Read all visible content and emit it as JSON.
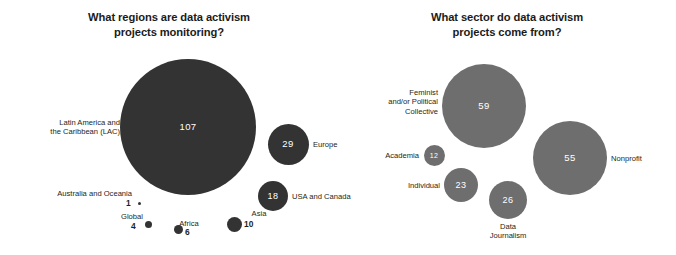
{
  "chart_data": [
    {
      "type": "bubble",
      "title": "What regions are data activism projects monitoring?",
      "title_lines": [
        "What regions are data activism",
        "projects monitoring?"
      ],
      "xlabel": "",
      "ylabel": "",
      "grid": false,
      "legend": "none",
      "bubble_color": "#333333",
      "value_label_color": "#ffffff",
      "categories": [
        "Latin America and the Caribbean (LAC)",
        "Europe",
        "USA and Canada",
        "Asia",
        "Africa",
        "Global",
        "Australia and Oceania"
      ],
      "values": [
        107,
        29,
        18,
        10,
        6,
        4,
        1
      ],
      "points": [
        {
          "label": "Latin America and\nthe Caribbean (LAC)",
          "value": "107",
          "cx": 188,
          "cy": 127,
          "d": 136,
          "value_inside": true,
          "label_pos": "left",
          "label_x": 24,
          "label_y": 118,
          "label_w": 96
        },
        {
          "label": "Europe",
          "value": "29",
          "cx": 288,
          "cy": 144,
          "d": 41,
          "value_inside": true,
          "label_pos": "right",
          "label_x": 313,
          "label_y": 140,
          "label_w": 60
        },
        {
          "label": "USA and Canada",
          "value": "18",
          "cx": 273,
          "cy": 196,
          "d": 30,
          "value_inside": true,
          "label_pos": "right",
          "label_x": 292,
          "label_y": 192,
          "label_w": 70
        },
        {
          "label": "Asia",
          "value": "10",
          "cx": 234,
          "cy": 224,
          "d": 15,
          "value_inside": false,
          "label_pos": "right-stack",
          "label_x": 244,
          "label_y": 209,
          "label_w": 30,
          "val_x": 244,
          "val_y": 220
        },
        {
          "label": "Africa",
          "value": "6",
          "cx": 178,
          "cy": 229,
          "d": 9,
          "value_inside": false,
          "label_pos": "right-stack",
          "label_x": 171,
          "label_y": 219,
          "label_w": 36,
          "val_x": 185,
          "val_y": 228
        },
        {
          "label": "Global",
          "value": "4",
          "cx": 148,
          "cy": 224,
          "d": 7,
          "value_inside": false,
          "label_pos": "left-stack",
          "label_x": 110,
          "label_y": 212,
          "label_w": 44,
          "val_x": 131,
          "val_y": 222
        },
        {
          "label": "Australia and Oceania",
          "value": "1",
          "cx": 139,
          "cy": 203,
          "d": 3,
          "value_inside": false,
          "label_pos": "above",
          "label_x": 32,
          "label_y": 189,
          "label_w": 100,
          "val_x": 126,
          "val_y": 199
        }
      ]
    },
    {
      "type": "bubble",
      "title": "What sector do data activism projects come from?",
      "title_lines": [
        "What sector do data activism",
        "projects come from?"
      ],
      "xlabel": "",
      "ylabel": "",
      "grid": false,
      "legend": "none",
      "bubble_color": "#6e6e6e",
      "value_label_color": "#ffffff",
      "categories": [
        "Feminist and/or Political Collective",
        "Nonprofit",
        "Data Journalism",
        "Individual",
        "Academia"
      ],
      "values": [
        59,
        55,
        26,
        23,
        12
      ],
      "points": [
        {
          "label": "Feminist\nand/or Political\nCollective",
          "value": "59",
          "cx": 484,
          "cy": 106,
          "d": 84,
          "value_inside": true,
          "label_pos": "left",
          "label_x": 373,
          "label_y": 88,
          "label_w": 65
        },
        {
          "label": "Nonprofit",
          "value": "55",
          "cx": 570,
          "cy": 158,
          "d": 74,
          "value_inside": true,
          "label_pos": "right",
          "label_x": 611,
          "label_y": 154,
          "label_w": 60
        },
        {
          "label": "Data\nJournalism",
          "value": "26",
          "cx": 508,
          "cy": 200,
          "d": 38,
          "value_inside": true,
          "label_pos": "below",
          "label_x": 473,
          "label_y": 222,
          "label_w": 70
        },
        {
          "label": "Individual",
          "value": "23",
          "cx": 461,
          "cy": 185,
          "d": 34,
          "value_inside": true,
          "label_pos": "left",
          "label_x": 384,
          "label_y": 181,
          "label_w": 56
        },
        {
          "label": "Academia",
          "value": "12",
          "cx": 434,
          "cy": 155,
          "d": 21,
          "value_inside": true,
          "label_pos": "left",
          "label_x": 369,
          "label_y": 151,
          "label_w": 50
        }
      ]
    }
  ]
}
